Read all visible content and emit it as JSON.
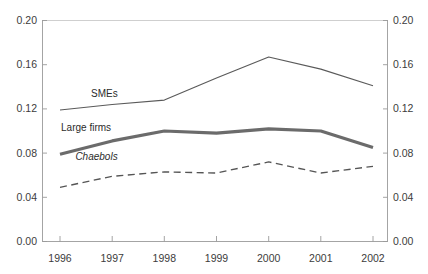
{
  "chart_data": {
    "type": "line",
    "title": "",
    "subtitle": "",
    "xlabel": "",
    "ylabel": "",
    "categories": [
      "1996",
      "1997",
      "1998",
      "1999",
      "2000",
      "2001",
      "2002"
    ],
    "x": [
      1996,
      1997,
      1998,
      1999,
      2000,
      2001,
      2002
    ],
    "xlim": [
      1996,
      2002
    ],
    "ylim": [
      0.0,
      0.2
    ],
    "yticks": [
      0.0,
      0.04,
      0.08,
      0.12,
      0.16,
      0.2
    ],
    "ytick_labels": [
      "0.00",
      "0.04",
      "0.08",
      "0.12",
      "0.16",
      "0.20"
    ],
    "ytick_labels_right": [
      "0.00",
      "0.04",
      "0.08",
      "0.12",
      "0.16",
      "0.20"
    ],
    "grid": false,
    "legend_position": "inline-annotations",
    "dual_y_axis": true,
    "series": [
      {
        "name": "SMEs",
        "style": "solid-thin",
        "color": "#5a5a5a",
        "values": [
          0.119,
          0.124,
          0.128,
          0.148,
          0.167,
          0.156,
          0.141
        ],
        "label_x": 1996.85,
        "label_y": 0.131
      },
      {
        "name": "Large firms",
        "style": "solid-thick",
        "color": "#6b6b6b",
        "values": [
          0.079,
          0.091,
          0.1,
          0.098,
          0.102,
          0.1,
          0.085
        ],
        "label_x": 1996.5,
        "label_y": 0.1
      },
      {
        "name": "Chaebols",
        "style": "dashed",
        "color": "#555555",
        "values": [
          0.049,
          0.059,
          0.063,
          0.062,
          0.072,
          0.062,
          0.068
        ],
        "label_x": 1996.7,
        "label_y": 0.074,
        "italic": true
      }
    ]
  }
}
